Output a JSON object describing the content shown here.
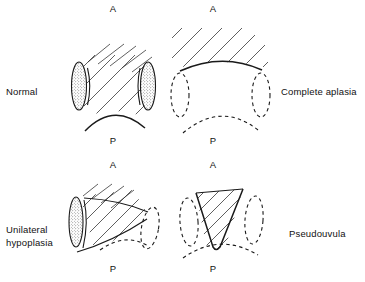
{
  "figure": {
    "colors": {
      "ink": "#111111",
      "line": "#1a1a1a",
      "hatch": "#2b2b2b",
      "stipple": "#555555",
      "background": "#ffffff"
    }
  },
  "panels": [
    {
      "id": "normal",
      "label": "Normal",
      "label_side": "left",
      "orientation": {
        "anterior": "A",
        "posterior": "P"
      },
      "features": {
        "hatched_muscle": "full",
        "left_mass": "solid-stippled",
        "right_mass": "solid-stippled",
        "posterior_border": "solid"
      }
    },
    {
      "id": "complete-aplasia",
      "label": "Complete aplasia",
      "label_side": "right",
      "orientation": {
        "anterior": "A",
        "posterior": "P"
      },
      "features": {
        "hatched_muscle": "absent-central",
        "left_mass": "dashed-outline",
        "right_mass": "dashed-outline",
        "posterior_border": "dashed"
      }
    },
    {
      "id": "unilateral-hypoplasia",
      "label": "Unilateral\nhypoplasia",
      "label_side": "left",
      "orientation": {
        "anterior": "A",
        "posterior": "P"
      },
      "features": {
        "hatched_muscle": "oblique-partial",
        "left_mass": "solid-stippled",
        "right_mass": "dashed-outline",
        "posterior_border": "dashed"
      }
    },
    {
      "id": "pseudouvula",
      "label": "Pseudouvula",
      "label_side": "right",
      "orientation": {
        "anterior": "A",
        "posterior": "P"
      },
      "features": {
        "hatched_muscle": "central-v-wedge",
        "left_mass": "dashed-outline",
        "right_mass": "dashed-outline",
        "posterior_border": "dashed"
      }
    }
  ]
}
